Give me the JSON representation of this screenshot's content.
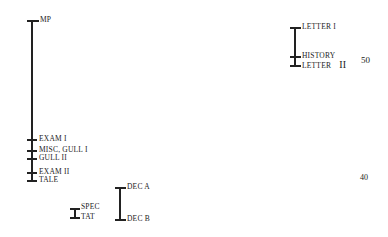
{
  "diagram": {
    "groups": [
      {
        "name": "left-column",
        "labels": [
          {
            "text": "MP",
            "y": 20
          },
          {
            "text": "EXAM I",
            "y": 139
          },
          {
            "text": "MISC, GULL I",
            "y": 150
          },
          {
            "text": "GULL II",
            "y": 158
          },
          {
            "text": "EXAM II",
            "y": 172
          },
          {
            "text": "TALE",
            "y": 180
          }
        ]
      },
      {
        "name": "spec-tat",
        "labels": [
          {
            "text": "SPEC",
            "y": 208
          },
          {
            "text": "TAT",
            "y": 217
          }
        ]
      },
      {
        "name": "dec",
        "labels": [
          {
            "text": "DEC A",
            "y": 187
          },
          {
            "text": "DEC B",
            "y": 219
          }
        ]
      },
      {
        "name": "right-column",
        "labels": [
          {
            "text": "LETTER I",
            "y": 27
          },
          {
            "text": "HISTORY",
            "y": 56
          },
          {
            "text": "LETTER",
            "y": 65,
            "suffix": "II"
          }
        ]
      }
    ],
    "scale": [
      {
        "text": "50",
        "y": 61
      },
      {
        "text": "40",
        "y": 178
      }
    ]
  }
}
